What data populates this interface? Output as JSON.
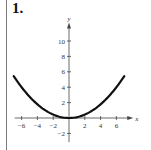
{
  "problem": {
    "number": "1."
  },
  "chart_data": {
    "type": "line",
    "title": "",
    "xlabel": "x",
    "ylabel": "y",
    "xlim": [
      -7,
      7.5
    ],
    "ylim": [
      -3,
      12
    ],
    "grid": false,
    "legend": null,
    "x_ticks": [
      -6,
      -4,
      -2,
      2,
      4,
      6
    ],
    "x_tick_labels": [
      "−6",
      "−4",
      "−2",
      "2",
      "4",
      "6"
    ],
    "y_ticks": [
      -2,
      2,
      4,
      6,
      8,
      10
    ],
    "y_tick_labels": [
      "−2",
      "2",
      "4",
      "6",
      "8",
      "10"
    ],
    "series": [
      {
        "name": "parabola",
        "description": "Upward-opening parabola with vertex at origin, approx y = x^2/9",
        "x": [
          -7,
          -6,
          -5,
          -4,
          -3,
          -2,
          -1,
          0,
          1,
          2,
          3,
          4,
          5,
          6,
          7
        ],
        "y": [
          5.44,
          4.0,
          2.78,
          1.78,
          1.0,
          0.44,
          0.11,
          0,
          0.11,
          0.44,
          1.0,
          1.78,
          2.78,
          4.0,
          5.44
        ]
      }
    ],
    "colors": {
      "curve": "#111111",
      "axes": "#444444"
    }
  }
}
